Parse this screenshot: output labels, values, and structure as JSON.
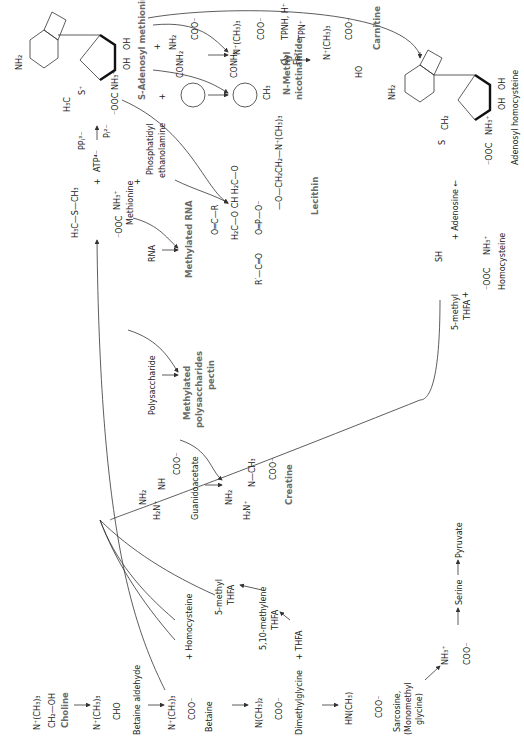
{
  "compounds": {
    "choline": {
      "name": "Choline",
      "f1": "N⁺(CH₃)₃",
      "f2": "CH₂—OH"
    },
    "betaine_aldehyde": {
      "name": "Betaine aldehyde",
      "f1": "N⁺(CH₃)₃",
      "f2": "CHO"
    },
    "betaine": {
      "name": "Betaine",
      "f1": "N⁺(CH₃)₃",
      "f2": "COO⁻"
    },
    "dimethylglycine": {
      "name": "Dimethylglycine",
      "f1": "N(CH₃)₂",
      "f2": "COO⁻",
      "plus": "+ THFA"
    },
    "sarcosine": {
      "name1": "Sarcosine,",
      "name2": "(Monomethyl",
      "name3": "glycine)",
      "f1": "HN(CH₃)",
      "f2": "COO⁻"
    },
    "glycine": {
      "f1": "NH₃⁺",
      "f2": "COO⁻"
    },
    "serine": {
      "name": "Serine"
    },
    "pyruvate": {
      "name": "Pyruvate"
    },
    "homocysteine_plus": "+ Homocysteine",
    "methyl_thfa": {
      "l1": "5-methyl",
      "l2": "THFA"
    },
    "methylene_thfa": {
      "l1": "5,10-methylene",
      "l2": "THFA"
    },
    "guanidoacetate": {
      "name": "Guanidoacetate",
      "f1": "NH₂",
      "f2": "H₂N⁺",
      "f3": "NH",
      "f4": "COO⁻"
    },
    "creatine": {
      "name": "Creatine",
      "f1": "NH₂",
      "f2": "H₂N⁺",
      "f3": "N—CH₃",
      "f4": "COO⁻"
    },
    "polysaccharide": {
      "name": "Polysaccharide"
    },
    "methylated_polysaccharides": {
      "l1": "Methylated",
      "l2": "polysaccharides",
      "l3": "pectin"
    },
    "rna": {
      "name": "RNA"
    },
    "methylated_rna": {
      "name": "Methylated RNA"
    },
    "methionine": {
      "name": "Methionine",
      "f1": "H₃C—S—CH₃",
      "f2": "⁻OOC",
      "f3": "NH₃⁺"
    },
    "atp": {
      "plus": "+",
      "name": "ATP⁴⁻",
      "pp": "PPᵢ³⁻",
      "p": "Pᵢ²⁻"
    },
    "phosphatidyl_ethanolamine": {
      "plus": "+",
      "l1": "Phosphatidyl",
      "l2": "ethanolamine"
    },
    "lecithin": {
      "name": "Lecithin",
      "r1": "O═C—R",
      "r2": "O═P—O⁻",
      "chain": "—O—CH₂CH₂—N⁺(CH₃)₃",
      "backbone": "H₂C—O   CH   H₂C—O",
      "r3": "R′—C═O"
    },
    "sam": {
      "name": "S-Adenosyl methionine",
      "nh2": "NH₂",
      "oh": "OH",
      "ooc": "⁻OOC",
      "nh3": "NH₃⁺",
      "h3c": "H₃C",
      "s": "S⁺"
    },
    "nicotinamide": {
      "plus": "+",
      "conh2": "CONH₂",
      "n": "N"
    },
    "n_methyl_nicotinamide": {
      "l1": "N-Methyl",
      "l2": "nicotinamide",
      "conh2": "CONH₂",
      "ch3": "CH₃"
    },
    "gaba_precursor": {
      "plus": "+",
      "nh2": "NH₂",
      "coo": "COO⁻"
    },
    "trimethyl_intermediate": {
      "n": "N⁺(CH₃)₃",
      "coo": "COO⁻"
    },
    "hydroxylation": {
      "o2": "O₂",
      "fe": "Fe²⁺",
      "tpnh": "TPNH, H⁺",
      "tpn": "TPN⁺"
    },
    "carnitine": {
      "name": "Carnitine",
      "n": "N⁺(CH₃)₃",
      "coo": "COO⁻",
      "ho": "HO"
    },
    "adenosyl_homocysteine": {
      "name": "Adenosyl homocysteine",
      "nh2": "NH₂",
      "ch2": "CH₂",
      "s": "S",
      "ooc": "⁻OOC",
      "nh3": "NH₃⁺"
    },
    "adenosine": {
      "text": "+ Adenosine ←"
    },
    "homocysteine": {
      "name": "Homocysteine",
      "sh": "SH",
      "ooc": "⁻OOC",
      "nh3": "NH₃⁺"
    },
    "methyl_thfa_right": {
      "l1": "5-methyl",
      "l2": "THFA",
      "plus": "+"
    }
  }
}
